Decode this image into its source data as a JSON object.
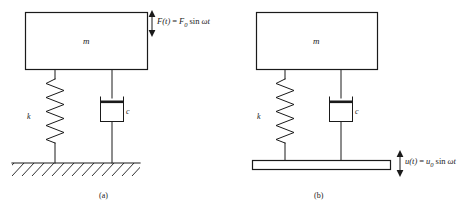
{
  "figure": {
    "background_color": "#ffffff",
    "line_color": "#1a1a1a",
    "panels": [
      {
        "id": "a",
        "caption": "(a)",
        "description": "Mass-spring-damper on fixed ground with harmonic force excitation",
        "mass_label": "m",
        "spring_label": "k",
        "damper_label": "c",
        "excitation": {
          "type": "force",
          "symbol": "F(t)",
          "equals": "=",
          "amplitude": "F",
          "amplitude_sub": "0",
          "trig": "sin",
          "argument": "ωt",
          "full_text": "F(t) = F0 sin ωt"
        },
        "support": {
          "type": "fixed-ground",
          "hatched": true
        }
      },
      {
        "id": "b",
        "caption": "(b)",
        "description": "Mass-spring-damper on moving base with harmonic base displacement excitation",
        "mass_label": "m",
        "spring_label": "k",
        "damper_label": "c",
        "excitation": {
          "type": "base-displacement",
          "symbol": "u(t)",
          "equals": "=",
          "amplitude": "u",
          "amplitude_sub": "0",
          "trig": "sin",
          "argument": "ωt",
          "full_text": "u(t) = u0 sin ωt"
        },
        "support": {
          "type": "moving-base",
          "hatched": false
        }
      }
    ]
  }
}
